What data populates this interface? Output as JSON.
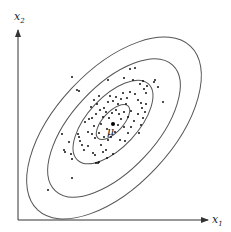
{
  "diagram": {
    "type": "bivariate-gaussian-contours",
    "axes": {
      "x_label": "x",
      "x_subscript": "1",
      "y_label": "x",
      "y_subscript": "2"
    },
    "mean_label": "μ",
    "contour_count": 4,
    "colors": {
      "axis": "#333333",
      "contour": "#555555",
      "points": "#111111"
    }
  }
}
